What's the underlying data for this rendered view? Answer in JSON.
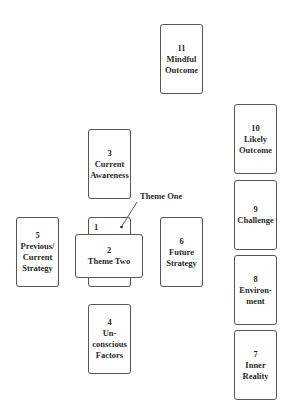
{
  "diagram": {
    "type": "card-spread-layout",
    "callout": {
      "label": "Theme One",
      "points_to_card": "1"
    },
    "cards": [
      {
        "id": "11",
        "number": "11",
        "lines": [
          "Mindful",
          "Outcome"
        ]
      },
      {
        "id": "3",
        "number": "3",
        "lines": [
          "Current",
          "Awareness"
        ]
      },
      {
        "id": "1",
        "number": "1",
        "lines": []
      },
      {
        "id": "2",
        "number": "2",
        "lines": [
          "Theme Two"
        ]
      },
      {
        "id": "5",
        "number": "5",
        "lines": [
          "Previous/",
          "Current",
          "Strategy"
        ]
      },
      {
        "id": "6",
        "number": "6",
        "lines": [
          "Future",
          "Strategy"
        ]
      },
      {
        "id": "4",
        "number": "4",
        "lines": [
          "Un-",
          "conscious",
          "Factors"
        ]
      },
      {
        "id": "10",
        "number": "10",
        "lines": [
          "Likely",
          "Outcome"
        ]
      },
      {
        "id": "9",
        "number": "9",
        "lines": [
          "Challenge"
        ]
      },
      {
        "id": "8",
        "number": "8",
        "lines": [
          "Environ-",
          "ment"
        ]
      },
      {
        "id": "7",
        "number": "7",
        "lines": [
          "Inner",
          "Reality"
        ]
      }
    ]
  }
}
